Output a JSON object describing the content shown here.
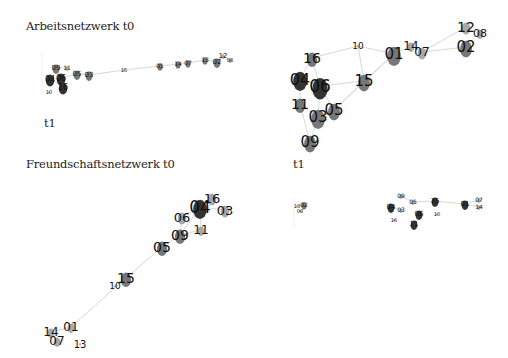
{
  "titles": {
    "work_t0": "Arbeitsnetzwerk  t0",
    "work_t1": "t1",
    "friend_t0": "Freundschaftsnetzwerk  t0",
    "friend_t1": "t1"
  },
  "colors": {
    "edge": "#d8d8d8",
    "node_dark": "#333333",
    "node_mid": "#777777",
    "node_light": "#a8a8a8",
    "label": "#111111"
  },
  "panels": [
    {
      "id": "work_t0",
      "title": "Arbeitsnetzwerk  t0",
      "nodes": [
        {
          "id": "09",
          "x": 56,
          "y": 68,
          "r": 4,
          "fs": 7,
          "shade": "mid"
        },
        {
          "id": "11",
          "x": 67,
          "y": 68,
          "r": 2,
          "fs": 6,
          "shade": "light"
        },
        {
          "id": "04",
          "x": 50,
          "y": 79,
          "r": 5,
          "fs": 8,
          "shade": "dark"
        },
        {
          "id": "06",
          "x": 61,
          "y": 78,
          "r": 5,
          "fs": 8,
          "shade": "dark"
        },
        {
          "id": "05",
          "x": 77,
          "y": 74,
          "r": 4,
          "fs": 7,
          "shade": "mid"
        },
        {
          "id": "03",
          "x": 89,
          "y": 75,
          "r": 4,
          "fs": 7,
          "shade": "mid"
        },
        {
          "id": "16",
          "x": 63,
          "y": 87,
          "r": 5,
          "fs": 8,
          "shade": "dark"
        },
        {
          "id": "10",
          "x": 49,
          "y": 92,
          "r": 1,
          "fs": 5,
          "shade": "light"
        },
        {
          "id": "15",
          "x": 124,
          "y": 70,
          "r": 1,
          "fs": 5,
          "shade": "light"
        },
        {
          "id": "01",
          "x": 160,
          "y": 66,
          "r": 3,
          "fs": 6,
          "shade": "mid"
        },
        {
          "id": "14",
          "x": 178,
          "y": 64,
          "r": 3,
          "fs": 6,
          "shade": "mid"
        },
        {
          "id": "07",
          "x": 188,
          "y": 63,
          "r": 3,
          "fs": 6,
          "shade": "mid"
        },
        {
          "id": "13",
          "x": 205,
          "y": 60,
          "r": 3,
          "fs": 6,
          "shade": "mid"
        },
        {
          "id": "02",
          "x": 217,
          "y": 62,
          "r": 4,
          "fs": 7,
          "shade": "mid"
        },
        {
          "id": "12",
          "x": 223,
          "y": 56,
          "r": 2,
          "fs": 7,
          "shade": "light"
        },
        {
          "id": "08",
          "x": 230,
          "y": 60,
          "r": 2,
          "fs": 5,
          "shade": "light"
        }
      ],
      "edges": [
        [
          "04",
          "06"
        ],
        [
          "06",
          "05"
        ],
        [
          "05",
          "03"
        ],
        [
          "03",
          "15"
        ],
        [
          "15",
          "01"
        ],
        [
          "01",
          "14"
        ],
        [
          "14",
          "07"
        ],
        [
          "07",
          "13"
        ],
        [
          "13",
          "02"
        ],
        [
          "02",
          "12"
        ],
        [
          "12",
          "08"
        ],
        [
          "06",
          "16"
        ],
        [
          "09",
          "06"
        ],
        [
          "09",
          "11"
        ],
        [
          "04",
          "16"
        ]
      ]
    },
    {
      "id": "work_t1",
      "title": "t1",
      "nodes": [
        {
          "id": "16",
          "x": 312,
          "y": 58,
          "r": 6,
          "fs": 14,
          "shade": "mid"
        },
        {
          "id": "10",
          "x": 358,
          "y": 46,
          "r": 1,
          "fs": 9,
          "shade": "light"
        },
        {
          "id": "01",
          "x": 394,
          "y": 54,
          "r": 8,
          "fs": 15,
          "shade": "mid"
        },
        {
          "id": "14",
          "x": 411,
          "y": 46,
          "r": 4,
          "fs": 12,
          "shade": "light"
        },
        {
          "id": "07",
          "x": 422,
          "y": 52,
          "r": 5,
          "fs": 12,
          "shade": "light"
        },
        {
          "id": "12",
          "x": 466,
          "y": 27,
          "r": 5,
          "fs": 14,
          "shade": "light"
        },
        {
          "id": "08",
          "x": 480,
          "y": 33,
          "r": 4,
          "fs": 11,
          "shade": "light"
        },
        {
          "id": "02",
          "x": 466,
          "y": 47,
          "r": 7,
          "fs": 15,
          "shade": "mid"
        },
        {
          "id": "04",
          "x": 300,
          "y": 79,
          "r": 8,
          "fs": 16,
          "shade": "dark"
        },
        {
          "id": "06",
          "x": 320,
          "y": 86,
          "r": 9,
          "fs": 17,
          "shade": "dark"
        },
        {
          "id": "15",
          "x": 364,
          "y": 81,
          "r": 7,
          "fs": 15,
          "shade": "mid"
        },
        {
          "id": "11",
          "x": 300,
          "y": 104,
          "r": 6,
          "fs": 14,
          "shade": "mid"
        },
        {
          "id": "03",
          "x": 318,
          "y": 117,
          "r": 8,
          "fs": 15,
          "shade": "mid"
        },
        {
          "id": "05",
          "x": 334,
          "y": 110,
          "r": 7,
          "fs": 15,
          "shade": "mid"
        },
        {
          "id": "09",
          "x": 310,
          "y": 142,
          "r": 7,
          "fs": 15,
          "shade": "mid"
        }
      ],
      "edges": [
        [
          "16",
          "10"
        ],
        [
          "10",
          "01"
        ],
        [
          "10",
          "15"
        ],
        [
          "01",
          "14"
        ],
        [
          "14",
          "07"
        ],
        [
          "07",
          "12"
        ],
        [
          "07",
          "02"
        ],
        [
          "01",
          "15"
        ],
        [
          "15",
          "06"
        ],
        [
          "15",
          "05"
        ],
        [
          "16",
          "04"
        ],
        [
          "16",
          "06"
        ],
        [
          "04",
          "06"
        ],
        [
          "04",
          "11"
        ],
        [
          "06",
          "05"
        ],
        [
          "06",
          "03"
        ],
        [
          "11",
          "03"
        ],
        [
          "11",
          "09"
        ],
        [
          "03",
          "05"
        ],
        [
          "03",
          "09"
        ],
        [
          "05",
          "01"
        ]
      ]
    },
    {
      "id": "friend_t0",
      "title": "Freundschaftsnetzwerk  t0",
      "nodes": [
        {
          "id": "04",
          "x": 200,
          "y": 207,
          "r": 8,
          "fs": 17,
          "shade": "dark"
        },
        {
          "id": "16",
          "x": 212,
          "y": 198,
          "r": 5,
          "fs": 13,
          "shade": "light"
        },
        {
          "id": "03",
          "x": 225,
          "y": 210,
          "r": 5,
          "fs": 13,
          "shade": "light"
        },
        {
          "id": "06",
          "x": 182,
          "y": 217,
          "r": 5,
          "fs": 13,
          "shade": "light"
        },
        {
          "id": "11",
          "x": 201,
          "y": 230,
          "r": 4,
          "fs": 12,
          "shade": "light"
        },
        {
          "id": "09",
          "x": 180,
          "y": 235,
          "r": 6,
          "fs": 14,
          "shade": "mid"
        },
        {
          "id": "05",
          "x": 162,
          "y": 247,
          "r": 6,
          "fs": 14,
          "shade": "mid"
        },
        {
          "id": "15",
          "x": 126,
          "y": 278,
          "r": 6,
          "fs": 14,
          "shade": "mid"
        },
        {
          "id": "10",
          "x": 115,
          "y": 286,
          "r": 1,
          "fs": 9,
          "shade": "light"
        },
        {
          "id": "01",
          "x": 71,
          "y": 327,
          "r": 4,
          "fs": 12,
          "shade": "light"
        },
        {
          "id": "14",
          "x": 51,
          "y": 332,
          "r": 4,
          "fs": 12,
          "shade": "light"
        },
        {
          "id": "07",
          "x": 57,
          "y": 341,
          "r": 4,
          "fs": 12,
          "shade": "light"
        },
        {
          "id": "13",
          "x": 80,
          "y": 344,
          "r": 1,
          "fs": 10,
          "shade": "light"
        }
      ],
      "edges": [
        [
          "04",
          "16"
        ],
        [
          "04",
          "03"
        ],
        [
          "04",
          "06"
        ],
        [
          "04",
          "11"
        ],
        [
          "04",
          "09"
        ],
        [
          "06",
          "09"
        ],
        [
          "09",
          "11"
        ],
        [
          "09",
          "05"
        ],
        [
          "05",
          "15"
        ],
        [
          "15",
          "10"
        ],
        [
          "15",
          "01"
        ],
        [
          "01",
          "14"
        ],
        [
          "14",
          "07"
        ]
      ]
    },
    {
      "id": "friend_t1",
      "title": "t1",
      "nodes": [
        {
          "id": "13",
          "x": 297,
          "y": 206,
          "r": 1,
          "fs": 5,
          "shade": "light"
        },
        {
          "id": "02",
          "x": 304,
          "y": 205,
          "r": 3,
          "fs": 6,
          "shade": "mid"
        },
        {
          "id": "08",
          "x": 300,
          "y": 211,
          "r": 1,
          "fs": 5,
          "shade": "light"
        },
        {
          "id": "09",
          "x": 401,
          "y": 196,
          "r": 2,
          "fs": 6,
          "shade": "light"
        },
        {
          "id": "05",
          "x": 413,
          "y": 202,
          "r": 2,
          "fs": 6,
          "shade": "light"
        },
        {
          "id": "15",
          "x": 435,
          "y": 201,
          "r": 4,
          "fs": 7,
          "shade": "dark"
        },
        {
          "id": "04",
          "x": 391,
          "y": 207,
          "r": 4,
          "fs": 7,
          "shade": "dark"
        },
        {
          "id": "03",
          "x": 401,
          "y": 210,
          "r": 2,
          "fs": 6,
          "shade": "light"
        },
        {
          "id": "06",
          "x": 419,
          "y": 214,
          "r": 4,
          "fs": 7,
          "shade": "dark"
        },
        {
          "id": "16",
          "x": 394,
          "y": 220,
          "r": 1,
          "fs": 5,
          "shade": "light"
        },
        {
          "id": "11",
          "x": 414,
          "y": 224,
          "r": 4,
          "fs": 7,
          "shade": "dark"
        },
        {
          "id": "10",
          "x": 437,
          "y": 214,
          "r": 1,
          "fs": 5,
          "shade": "light"
        },
        {
          "id": "01",
          "x": 465,
          "y": 204,
          "r": 4,
          "fs": 7,
          "shade": "dark"
        },
        {
          "id": "07",
          "x": 479,
          "y": 200,
          "r": 2,
          "fs": 6,
          "shade": "light"
        },
        {
          "id": "14",
          "x": 479,
          "y": 207,
          "r": 2,
          "fs": 6,
          "shade": "light"
        }
      ],
      "edges": [
        [
          "05",
          "15"
        ],
        [
          "15",
          "01"
        ],
        [
          "01",
          "07"
        ],
        [
          "01",
          "14"
        ],
        [
          "04",
          "03"
        ],
        [
          "09",
          "05"
        ],
        [
          "06",
          "11"
        ],
        [
          "13",
          "02"
        ]
      ]
    }
  ]
}
